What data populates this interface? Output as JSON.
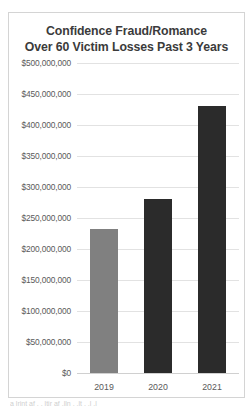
{
  "chart_data": {
    "type": "bar",
    "title": "Confidence Fraud/Romance Over 60 Victim Losses Past 3 Years",
    "title_lines": [
      "Confidence Fraud/Romance",
      "Over 60 Victim Losses Past 3 Years"
    ],
    "categories": [
      "2019",
      "2020",
      "2021"
    ],
    "values": [
      232000000,
      281000000,
      430000000
    ],
    "xlabel": "",
    "ylabel": "",
    "ylim": [
      0,
      500000000
    ],
    "ytick_values": [
      500000000,
      450000000,
      400000000,
      350000000,
      300000000,
      250000000,
      200000000,
      150000000,
      100000000,
      50000000,
      0
    ],
    "ytick_labels": [
      "$500,000,000",
      "$450,000,000",
      "$400,000,000",
      "$350,000,000",
      "$300,000,000",
      "$250,000,000",
      "$200,000,000",
      "$150,000,000",
      "$100,000,000",
      "$50,000,000",
      "$0"
    ],
    "bar_colors": [
      "#808080",
      "#2b2b2b",
      "#2b2b2b"
    ],
    "grid": true,
    "legend": false,
    "legend_position": "none"
  },
  "colors": {
    "title_text": "#3b3b3b",
    "tick_text": "#5a5a5a",
    "gridline": "#e2e2e2",
    "border": "#d4d4d4",
    "background": "#ffffff"
  },
  "page": {
    "bleed_text": "a  lrint  af  .  .  ltir   af   .lln    . .lt   . .l .l"
  }
}
